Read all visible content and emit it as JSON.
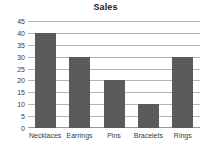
{
  "chart_data": {
    "type": "bar",
    "title": "Sales",
    "xlabel": "",
    "ylabel": "",
    "categories": [
      "Necklaces",
      "Earrings",
      "Pins",
      "Bracelets",
      "Rings"
    ],
    "values": [
      40,
      30,
      20,
      10,
      30
    ],
    "ylim": [
      0,
      45
    ],
    "yticks": [
      0,
      5,
      10,
      15,
      20,
      25,
      30,
      35,
      40,
      45
    ],
    "ytick_labels": [
      "0",
      "5",
      "10",
      "15",
      "20",
      "25",
      "30",
      "35",
      "40",
      "45"
    ],
    "grid": true,
    "grid_axis": "y",
    "legend": false,
    "legend_position": "none",
    "colors": {
      "bar_fill": "#5b5b5b",
      "gridline": "#b5b5b5",
      "baseline": "#9a9a9a",
      "title_text": "#1a1a1a",
      "tick_text": "#3a3a3a",
      "background": "#ffffff"
    }
  }
}
